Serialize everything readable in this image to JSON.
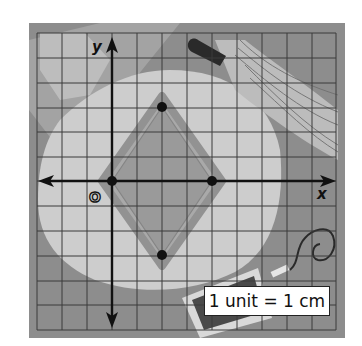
{
  "figure": {
    "type": "coordinate-grid-diagram",
    "axes": {
      "x_label": "x",
      "y_label": "y",
      "origin_label": "O"
    },
    "grid": {
      "columns": 12,
      "rows": 12,
      "cell_size_px": 25,
      "origin_column_index": 3,
      "origin_row_index": 6
    },
    "scale_note": "1 unit = 1 cm",
    "shape": {
      "name": "rhombus",
      "vertices": [
        {
          "x": 0,
          "y": 0
        },
        {
          "x": 2,
          "y": 3
        },
        {
          "x": 4,
          "y": 0
        },
        {
          "x": 2,
          "y": -3
        }
      ]
    },
    "colors": {
      "frame": "#8f8f8f",
      "grid_line": "#3a3a3a",
      "bg_dark": "#8a8a8a",
      "bg_mid": "#a9a9a9",
      "bg_light": "#cfcfcf",
      "shape_fill": "#9a9a9a",
      "axis": "#111111",
      "point": "#111111"
    }
  }
}
